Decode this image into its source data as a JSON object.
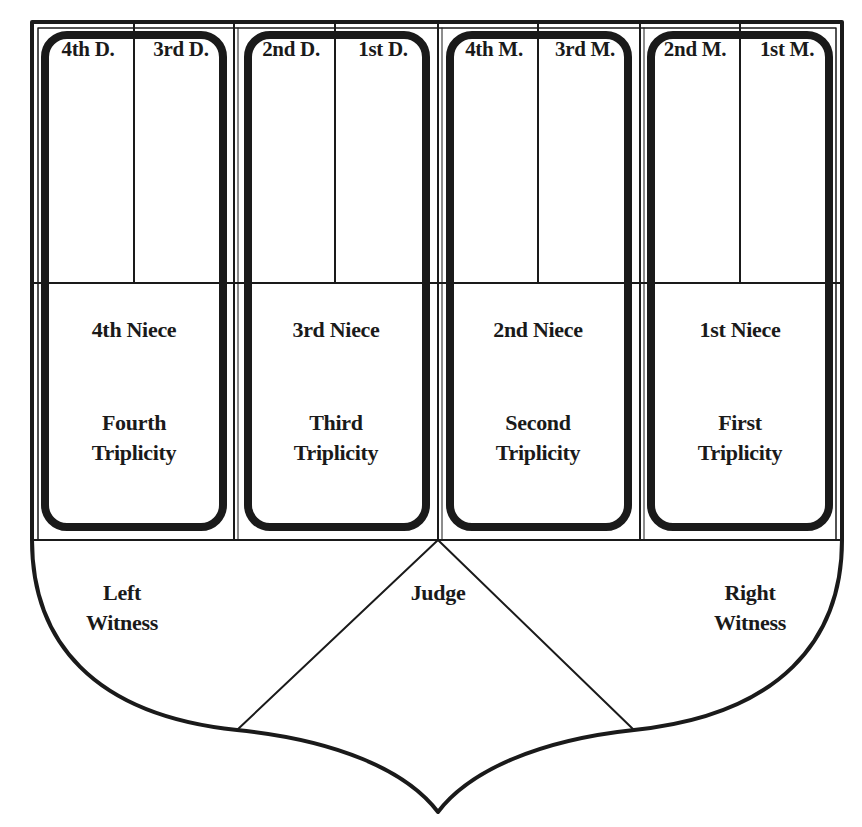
{
  "diagram": {
    "title": "",
    "colors": {
      "ink": "#1a1a1a",
      "background": "#ffffff"
    },
    "mothers_daughters": [
      {
        "label": "4th D.",
        "cx": 86
      },
      {
        "label": "3rd D.",
        "cx": 183
      },
      {
        "label": "2nd D.",
        "cx": 285
      },
      {
        "label": "1st D.",
        "cx": 385
      },
      {
        "label": "4th M.",
        "cx": 488
      },
      {
        "label": "3rd M.",
        "cx": 587
      },
      {
        "label": "2nd M.",
        "cx": 690
      },
      {
        "label": "1st M.",
        "cx": 791
      }
    ],
    "nieces": [
      {
        "label": "4th Niece",
        "cx": 134
      },
      {
        "label": "3rd Niece",
        "cx": 336
      },
      {
        "label": "2nd Niece",
        "cx": 538
      },
      {
        "label": "1st Niece",
        "cx": 740
      }
    ],
    "triplicities": [
      {
        "line1": "Fourth",
        "line2": "Triplicity",
        "cx": 134
      },
      {
        "line1": "Third",
        "line2": "Triplicity",
        "cx": 336
      },
      {
        "line1": "Second",
        "line2": "Triplicity",
        "cx": 538
      },
      {
        "line1": "First",
        "line2": "Triplicity",
        "cx": 740
      }
    ],
    "witnesses": {
      "left": {
        "line1": "Left",
        "line2": "Witness"
      },
      "right": {
        "line1": "Right",
        "line2": "Witness"
      }
    },
    "judge": {
      "label": "Judge"
    }
  }
}
